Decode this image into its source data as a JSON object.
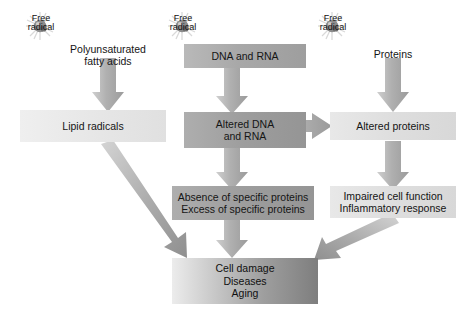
{
  "diagram": {
    "background_color": "#ffffff",
    "icon_label": "Free\nradical",
    "icons": [
      {
        "name": "free-radical-icon-lipid",
        "label": "Free\nradical"
      },
      {
        "name": "free-radical-icon-nucleic",
        "label": "Free\nradical"
      },
      {
        "name": "free-radical-icon-protein",
        "label": "Free\nradical"
      }
    ],
    "nodes": [
      {
        "id": "pufa",
        "label": "Polyunsaturated\nfatty acids",
        "style": "plain"
      },
      {
        "id": "lipid_radicals",
        "label": "Lipid radicals",
        "style": "fill-vlight"
      },
      {
        "id": "dna_rna",
        "label": "DNA and RNA",
        "style": "fill-mid"
      },
      {
        "id": "altered_dna_rna",
        "label": "Altered DNA\nand RNA",
        "style": "fill-dark"
      },
      {
        "id": "specific_proteins",
        "label": "Absence of specific proteins\nExcess of specific proteins",
        "style": "fill-dark"
      },
      {
        "id": "proteins",
        "label": "Proteins",
        "style": "plain"
      },
      {
        "id": "altered_proteins",
        "label": "Altered proteins",
        "style": "fill-light"
      },
      {
        "id": "impaired_cell",
        "label": "Impaired cell function\nInflammatory response",
        "style": "fill-light"
      },
      {
        "id": "outcome",
        "label": "Cell damage\nDiseases\nAging",
        "style": "fill-final"
      }
    ],
    "edges": [
      {
        "from": "pufa",
        "to": "lipid_radicals",
        "kind": "down"
      },
      {
        "from": "dna_rna",
        "to": "altered_dna_rna",
        "kind": "down"
      },
      {
        "from": "altered_dna_rna",
        "to": "specific_proteins",
        "kind": "down"
      },
      {
        "from": "altered_dna_rna",
        "to": "altered_proteins",
        "kind": "right"
      },
      {
        "from": "proteins",
        "to": "altered_proteins",
        "kind": "down"
      },
      {
        "from": "altered_proteins",
        "to": "impaired_cell",
        "kind": "down"
      },
      {
        "from": "specific_proteins",
        "to": "outcome",
        "kind": "down"
      },
      {
        "from": "lipid_radicals",
        "to": "outcome",
        "kind": "diagonal-down-right"
      },
      {
        "from": "impaired_cell",
        "to": "outcome",
        "kind": "diagonal-down-left"
      }
    ],
    "arrow_color": "#a6a6a6"
  }
}
